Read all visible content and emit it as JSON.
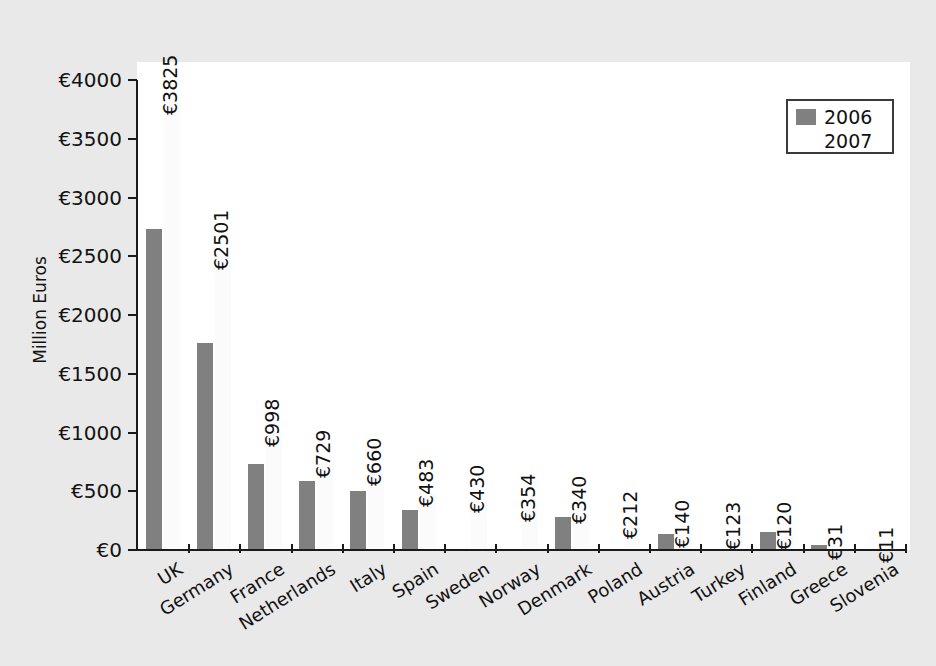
{
  "chart_data": {
    "type": "bar",
    "title": "",
    "xlabel": "",
    "ylabel": "Million Euros",
    "ylim": [
      0,
      4000
    ],
    "ytick_labels": [
      "€0",
      "€500",
      "€1000",
      "€1500",
      "€2000",
      "€2500",
      "€3000",
      "€3500",
      "€4000"
    ],
    "ytick_values": [
      0,
      500,
      1000,
      1500,
      2000,
      2500,
      3000,
      3500,
      4000
    ],
    "grid": false,
    "legend_position": "top-right",
    "categories": [
      "UK",
      "Germany",
      "France",
      "Netherlands",
      "Italy",
      "Spain",
      "Sweden",
      "Norway",
      "Denmark",
      "Poland",
      "Austria",
      "Turkey",
      "Finland",
      "Greece",
      "Slovenia"
    ],
    "series": [
      {
        "name": "2006",
        "color": "#808080",
        "values": [
          2735,
          1765,
          735,
          585,
          500,
          340,
          0,
          0,
          280,
          0,
          140,
          0,
          150,
          40,
          0
        ]
      },
      {
        "name": "2007",
        "color": "#fbfbfb",
        "values": [
          3825,
          2501,
          998,
          729,
          660,
          483,
          430,
          354,
          340,
          212,
          140,
          123,
          120,
          31,
          11
        ],
        "data_labels": [
          "€3825",
          "€2501",
          "€998",
          "€729",
          "€660",
          "€483",
          "€430",
          "€354",
          "€340",
          "€212",
          "€140",
          "€123",
          "€120",
          "€31",
          "€11"
        ]
      }
    ]
  },
  "legend": {
    "entries": [
      {
        "label": "2006",
        "color": "#808080"
      },
      {
        "label": "2007",
        "color": "#ffffff"
      }
    ]
  },
  "axis": {
    "y_title": "Million Euros"
  },
  "colors": {
    "background": "#e9e9e9",
    "plot_background": "#ffffff",
    "axis": "#1a1a1a",
    "series_2006": "#808080",
    "series_2007": "#fbfbfb",
    "text": "#131313"
  }
}
